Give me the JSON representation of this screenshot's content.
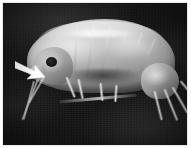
{
  "figure": {
    "kind": "photomicrograph",
    "modality": "grayscale light micrograph",
    "background_description": "dark mottled field",
    "alt_text": "Grayscale micrograph of an amphipod crustacean in lateral view on a dark background, with a white arrow pointing to the head region",
    "border_present": "true"
  },
  "annotations": {
    "arrow": {
      "name": "white arrow marker",
      "direction": "right-and-down",
      "color": "#ffffff",
      "points_at": "head / anterior region of specimen",
      "x": 12,
      "y": 56,
      "width": 34,
      "height": 22
    }
  },
  "specimen_parts": [
    {
      "id": "body-main",
      "label": "pereon / dorsal body"
    },
    {
      "id": "carapace",
      "label": "dorsal carapace arc"
    },
    {
      "id": "head",
      "label": "head"
    },
    {
      "id": "eye",
      "label": "compound eye"
    },
    {
      "id": "rostrum",
      "label": "rostrum"
    },
    {
      "id": "urosome",
      "label": "urosome / posterior"
    },
    {
      "id": "antennae",
      "label": "antennae"
    },
    {
      "id": "gnathopods",
      "label": "gnathopods"
    },
    {
      "id": "pereopods",
      "label": "pereopods"
    },
    {
      "id": "uropods",
      "label": "uropods"
    }
  ],
  "palette": {
    "background_dark": "#151515",
    "specimen_light": "#dddddd",
    "specimen_mid": "#9a9a9a",
    "specimen_shadow": "#4e4e4e",
    "arrow": "#ffffff",
    "frame": "#fefefe",
    "border_line": "#e8e8e8"
  },
  "text": {
    "visible_labels": [],
    "caption": ""
  }
}
